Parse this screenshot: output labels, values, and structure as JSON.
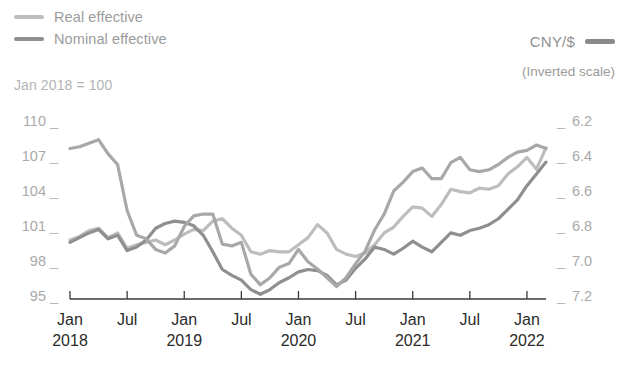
{
  "legend": {
    "series": [
      {
        "label": "Real effective",
        "color": "#bdbdbd",
        "icon": "line-swatch"
      },
      {
        "label": "Nominal effective",
        "color": "#8f8f8f",
        "icon": "line-swatch"
      }
    ],
    "right": {
      "label": "CNY/$",
      "color": "#8a8a8a",
      "note": "(Inverted scale)",
      "icon": "line-swatch"
    }
  },
  "subtitle": "Jan 2018 = 100",
  "axes": {
    "left_ticks": [
      "110",
      "107",
      "104",
      "101",
      "98",
      "95"
    ],
    "right_ticks": [
      "6.2",
      "6.4",
      "6.6",
      "6.8",
      "7.0",
      "7.2"
    ],
    "tick_dash": "_",
    "x_labels": [
      {
        "month": "Jan",
        "year": "2018"
      },
      {
        "month": "Jul",
        "year": ""
      },
      {
        "month": "Jan",
        "year": "2019"
      },
      {
        "month": "Jul",
        "year": ""
      },
      {
        "month": "Jan",
        "year": "2020"
      },
      {
        "month": "Jul",
        "year": ""
      },
      {
        "month": "Jan",
        "year": "2021"
      },
      {
        "month": "Jul",
        "year": ""
      },
      {
        "month": "Jan",
        "year": "2022"
      }
    ]
  },
  "chart_data": {
    "type": "line",
    "title": "",
    "subtitle": "Jan 2018 = 100",
    "xlabel": "",
    "ylabel": "",
    "grid": false,
    "legend_position": "top-left",
    "x": [
      "2018-01",
      "2018-02",
      "2018-03",
      "2018-04",
      "2018-05",
      "2018-06",
      "2018-07",
      "2018-08",
      "2018-09",
      "2018-10",
      "2018-11",
      "2018-12",
      "2019-01",
      "2019-02",
      "2019-03",
      "2019-04",
      "2019-05",
      "2019-06",
      "2019-07",
      "2019-08",
      "2019-09",
      "2019-10",
      "2019-11",
      "2019-12",
      "2020-01",
      "2020-02",
      "2020-03",
      "2020-04",
      "2020-05",
      "2020-06",
      "2020-07",
      "2020-08",
      "2020-09",
      "2020-10",
      "2020-11",
      "2020-12",
      "2021-01",
      "2021-02",
      "2021-03",
      "2021-04",
      "2021-05",
      "2021-06",
      "2021-07",
      "2021-08",
      "2021-09",
      "2021-10",
      "2021-11",
      "2021-12",
      "2022-01",
      "2022-02",
      "2022-03"
    ],
    "axes": {
      "left": {
        "label": "Index (Jan 2018 = 100)",
        "ticks": [
          95,
          98,
          101,
          104,
          107,
          110
        ],
        "ylim": [
          95,
          110
        ]
      },
      "right": {
        "label": "CNY/$",
        "ticks": [
          6.2,
          6.4,
          6.6,
          6.8,
          7.0,
          7.2
        ],
        "ylim": [
          7.2,
          6.2
        ],
        "inverted": true
      }
    },
    "series": [
      {
        "name": "Real effective",
        "axis": "left",
        "color": "#bdbdbd",
        "values": [
          100.0,
          100.3,
          100.8,
          101.0,
          100.2,
          100.6,
          99.3,
          99.6,
          99.8,
          100.0,
          99.6,
          100.0,
          100.5,
          100.9,
          100.8,
          101.6,
          101.8,
          101.0,
          100.4,
          99.0,
          98.8,
          99.1,
          99.0,
          99.0,
          99.6,
          100.2,
          101.3,
          100.6,
          99.2,
          98.8,
          98.6,
          98.9,
          99.6,
          100.6,
          101.1,
          102.0,
          102.8,
          102.7,
          102.0,
          103.0,
          104.3,
          104.1,
          104.0,
          104.4,
          104.3,
          104.6,
          105.6,
          106.2,
          107.0,
          106.0,
          107.8
        ]
      },
      {
        "name": "Nominal effective",
        "axis": "left",
        "color": "#8f8f8f",
        "values": [
          99.8,
          100.2,
          100.6,
          100.9,
          100.1,
          100.4,
          99.1,
          99.4,
          100.0,
          101.0,
          101.4,
          101.6,
          101.5,
          101.2,
          100.4,
          99.0,
          97.5,
          97.0,
          96.6,
          95.8,
          95.4,
          95.8,
          96.4,
          96.8,
          97.3,
          97.5,
          97.4,
          97.0,
          96.2,
          96.6,
          97.6,
          98.4,
          99.4,
          99.2,
          98.8,
          99.3,
          99.9,
          99.4,
          99.0,
          99.8,
          100.6,
          100.4,
          100.8,
          101.0,
          101.3,
          101.8,
          102.6,
          103.4,
          104.6,
          105.6,
          106.6
        ]
      },
      {
        "name": "CNY/$",
        "axis": "right",
        "color": "#a8a8a8",
        "values": [
          6.35,
          6.34,
          6.32,
          6.3,
          6.38,
          6.44,
          6.7,
          6.84,
          6.86,
          6.92,
          6.94,
          6.9,
          6.79,
          6.73,
          6.72,
          6.72,
          6.89,
          6.9,
          6.88,
          7.06,
          7.12,
          7.08,
          7.02,
          7.0,
          6.92,
          6.99,
          7.03,
          7.08,
          7.13,
          7.08,
          7.0,
          6.93,
          6.81,
          6.72,
          6.59,
          6.54,
          6.48,
          6.46,
          6.52,
          6.52,
          6.43,
          6.4,
          6.47,
          6.48,
          6.47,
          6.44,
          6.4,
          6.37,
          6.36,
          6.33,
          6.35
        ]
      }
    ]
  }
}
